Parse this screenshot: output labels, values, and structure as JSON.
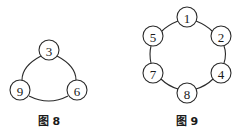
{
  "figures": [
    {
      "caption": "图 8",
      "nodes": [
        {
          "label": "3",
          "x": 49,
          "y": 50
        },
        {
          "label": "9",
          "x": 20,
          "y": 90
        },
        {
          "label": "6",
          "x": 77,
          "y": 90
        }
      ],
      "edges": [
        [
          "3",
          "9"
        ],
        [
          "9",
          "6"
        ],
        [
          "6",
          "3"
        ]
      ],
      "caption_pos": {
        "x": 49,
        "y": 125
      }
    },
    {
      "caption": "图 9",
      "nodes": [
        {
          "label": "1",
          "x": 187,
          "y": 17
        },
        {
          "label": "2",
          "x": 221,
          "y": 36
        },
        {
          "label": "4",
          "x": 221,
          "y": 73
        },
        {
          "label": "8",
          "x": 187,
          "y": 93
        },
        {
          "label": "7",
          "x": 153,
          "y": 73
        },
        {
          "label": "5",
          "x": 153,
          "y": 36
        }
      ],
      "edges": [
        [
          "1",
          "2"
        ],
        [
          "2",
          "4"
        ],
        [
          "4",
          "8"
        ],
        [
          "8",
          "7"
        ],
        [
          "7",
          "5"
        ],
        [
          "5",
          "1"
        ]
      ],
      "caption_pos": {
        "x": 187,
        "y": 125
      }
    }
  ],
  "node_radius": 10
}
